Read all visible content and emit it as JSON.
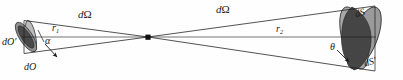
{
  "figure": {
    "type": "diagram",
    "background_color": "#ffffff",
    "stroke_color": "#1a1a1a",
    "canvas": {
      "width": 403,
      "height": 80
    }
  },
  "labels": {
    "d_omega_left": {
      "d": "d",
      "omega": "Ω"
    },
    "d_omega_right": {
      "d": "d",
      "omega": "Ω"
    },
    "r1": {
      "base": "r",
      "sub": "1"
    },
    "r2": {
      "base": "r",
      "sub": "2"
    },
    "alpha": "α",
    "theta": "θ",
    "dO_prime": "dO′",
    "dO": "dO",
    "dS": "dS",
    "dS_prime": "dS′"
  },
  "geometry": {
    "vertex": {
      "x": 148,
      "y": 37,
      "name": "cone-apex-point"
    },
    "axis_line": {
      "x1": 30,
      "y1": 37,
      "x2": 370,
      "y2": 37
    },
    "left_cone": {
      "upper_ray": {
        "x1": 148,
        "y1": 37,
        "x2": 30,
        "y2": 21
      },
      "lower_ray": {
        "x1": 148,
        "y1": 37,
        "x2": 30,
        "y2": 53
      }
    },
    "right_cone": {
      "upper_ray": {
        "x1": 148,
        "y1": 37,
        "x2": 372,
        "y2": 7
      },
      "lower_ray": {
        "x1": 148,
        "y1": 37,
        "x2": 372,
        "y2": 70
      }
    },
    "left_patch": {
      "tilted_ellipse_dO": {
        "cx": 27,
        "cy": 37,
        "rx": 6,
        "ry": 17,
        "rotation_deg": -34,
        "fill": "#8f8f8f"
      },
      "dark_inner_dO_prime": {
        "cx": 26,
        "cy": 37,
        "rx": 4.5,
        "ry": 13,
        "rotation_deg": -34,
        "fill": "#4a4a4a"
      },
      "normal_ellipse": {
        "cx": 32,
        "cy": 36,
        "rx": 4,
        "ry": 15,
        "rotation_deg": -10,
        "fill": "#b5b5b5"
      }
    },
    "right_patch": {
      "ellipse_dS_prime_back": {
        "cx": 364,
        "cy": 38,
        "rx": 13,
        "ry": 33,
        "rotation_deg": 22,
        "fill": "#9b9b9b"
      },
      "ellipse_dS_front": {
        "cx": 355,
        "cy": 38,
        "rx": 12,
        "ry": 32,
        "rotation_deg": -14,
        "fill": "#a6a6a6"
      },
      "dark_lens_overlap": {
        "cx": 361,
        "cy": 38,
        "rx": 11,
        "ry": 30,
        "rotation_deg": 4,
        "fill": "#454545"
      }
    },
    "angle_arrows": [
      {
        "name": "alpha-arrow",
        "x1": 46,
        "y1": 44,
        "x2": 58,
        "y2": 57
      },
      {
        "name": "theta-arrow",
        "x1": 338,
        "y1": 50,
        "x2": 350,
        "y2": 62
      }
    ]
  },
  "colors": {
    "line": "#1a1a1a",
    "fill_light": "#b5b5b5",
    "fill_mid": "#9b9b9b",
    "fill_dark": "#454545",
    "text": "#1a1a1a"
  }
}
